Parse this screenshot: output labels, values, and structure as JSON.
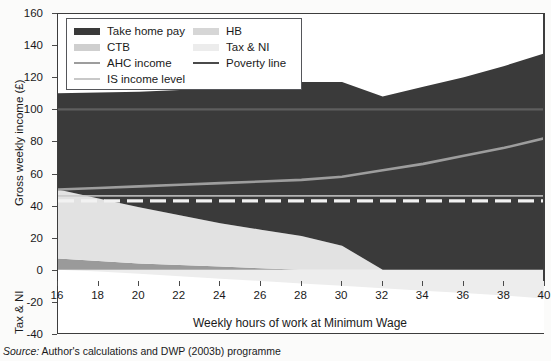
{
  "figure": {
    "source_prefix": "Source:",
    "source_text": " Author's calculations and DWP (2003b) programme"
  },
  "chart_data": {
    "type": "area",
    "title": "",
    "xlabel": "Weekly hours of work at Minimum Wage",
    "ylabel": "Gross weekly income (£)",
    "ylabel_secondary": "Tax & NI",
    "xlim": [
      16,
      40
    ],
    "ylim": [
      -40,
      160
    ],
    "xticks": [
      16,
      18,
      20,
      22,
      24,
      26,
      28,
      30,
      32,
      34,
      36,
      38,
      40
    ],
    "yticks": [
      -40,
      -20,
      0,
      20,
      40,
      60,
      80,
      100,
      120,
      140,
      160
    ],
    "grid": false,
    "legend_position": "top-left-inside",
    "x": [
      16,
      18,
      20,
      22,
      24,
      26,
      28,
      30,
      32,
      34,
      36,
      38,
      40
    ],
    "series": [
      {
        "name": "Take home pay",
        "kind": "stacked-area",
        "color": "#3a3a3a",
        "values": [
          60,
          66,
          72,
          78,
          84,
          90,
          96,
          102,
          108,
          114,
          120,
          127,
          135
        ]
      },
      {
        "name": "HB",
        "kind": "stacked-area",
        "color": "#e2e2e2",
        "note": "housing benefit, stacked below take home pay; tapers to zero at 32 hours",
        "values": [
          43,
          39,
          35,
          31,
          27,
          24,
          21,
          15,
          0,
          0,
          0,
          0,
          0
        ]
      },
      {
        "name": "CTB",
        "kind": "stacked-area",
        "color": "#9a9a9a",
        "note": "council tax benefit, thin band at the base; tapers to zero near 26 hours",
        "values": [
          7,
          5.5,
          4,
          3,
          2,
          1,
          0,
          0,
          0,
          0,
          0,
          0,
          0
        ]
      },
      {
        "name": "Tax & NI",
        "kind": "stacked-area-negative",
        "color": "#ededed",
        "note": "plotted below the zero line",
        "values": [
          0,
          -1,
          -2.5,
          -4,
          -5.5,
          -7,
          -8.5,
          -10,
          -11.5,
          -13,
          -14.5,
          -16,
          -18
        ]
      },
      {
        "name": "AHC income",
        "kind": "line",
        "color": "#9d9d9d",
        "values": [
          50,
          51,
          52,
          53,
          54,
          55,
          56,
          58,
          62,
          66,
          71,
          76,
          82
        ]
      },
      {
        "name": "IS income level",
        "kind": "line",
        "color": "#c8c8c8",
        "values": [
          46,
          46,
          46,
          46,
          46,
          46,
          46,
          46,
          46,
          46,
          46,
          46,
          46
        ]
      },
      {
        "name": "Poverty line",
        "kind": "line-dashed",
        "color": "#f2f2f2",
        "values": [
          43,
          43,
          43,
          43,
          43,
          43,
          43,
          43,
          43,
          43,
          43,
          43,
          43
        ]
      }
    ],
    "reference_lines": [
      {
        "name": "100-level rule",
        "y": 100,
        "color": "#5e5e5e"
      }
    ],
    "legend": [
      {
        "label": "Take home pay",
        "color": "#3a3a3a",
        "swatch": "block"
      },
      {
        "label": "CTB",
        "color": "#cfcfcf",
        "swatch": "block"
      },
      {
        "label": "AHC income",
        "color": "#9d9d9d",
        "swatch": "line"
      },
      {
        "label": "IS income level",
        "color": "#c8c8c8",
        "swatch": "thin"
      },
      {
        "label": "HB",
        "color": "#d6d6d6",
        "swatch": "block"
      },
      {
        "label": "Tax & NI",
        "color": "#ececec",
        "swatch": "block"
      },
      {
        "label": "Poverty line",
        "color": "#4a4a4a",
        "swatch": "line"
      }
    ]
  }
}
